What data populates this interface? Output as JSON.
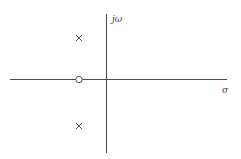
{
  "diagram": {
    "type": "pole-zero plot",
    "axes": {
      "imaginary_label": "jω",
      "real_label": "σ"
    },
    "poles": [
      {
        "symbol": "×",
        "position": "upper-left half-plane"
      },
      {
        "symbol": "×",
        "position": "lower-left half-plane"
      }
    ],
    "zeros": [
      {
        "symbol": "○",
        "position": "negative real axis"
      }
    ],
    "colors": {
      "axis": "#4a4a4a",
      "marker": "#555555",
      "background": "#ffffff"
    }
  }
}
